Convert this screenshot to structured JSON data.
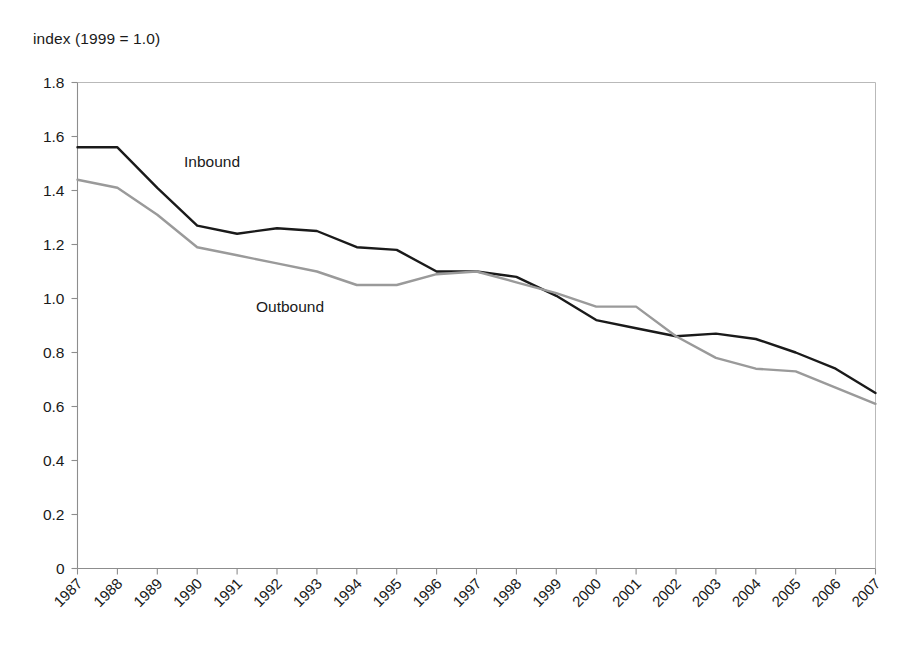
{
  "chart_data": {
    "type": "line",
    "title": "",
    "subtitle": "",
    "ylabel": "index (1999 = 1.0)",
    "xlabel": "",
    "ylim": [
      0,
      1.8
    ],
    "yticks": [
      "0",
      "0.2",
      "0.4",
      "0.6",
      "0.8",
      "1.0",
      "1.2",
      "1.4",
      "1.6",
      "1.8"
    ],
    "ytick_values": [
      0,
      0.2,
      0.4,
      0.6,
      0.8,
      1.0,
      1.2,
      1.4,
      1.6,
      1.8
    ],
    "grid": false,
    "legend_position": "inline-annotations",
    "categories": [
      "1987",
      "1988",
      "1989",
      "1990",
      "1991",
      "1992",
      "1993",
      "1994",
      "1995",
      "1996",
      "1997",
      "1998",
      "1999",
      "2000",
      "2001",
      "2002",
      "2003",
      "2004",
      "2005",
      "2006",
      "2007"
    ],
    "x": [
      1987,
      1988,
      1989,
      1990,
      1991,
      1992,
      1993,
      1994,
      1995,
      1996,
      1997,
      1998,
      1999,
      2000,
      2001,
      2002,
      2003,
      2004,
      2005,
      2006,
      2007
    ],
    "series": [
      {
        "name": "Inbound",
        "color": "#1a1a1a",
        "values": [
          1.56,
          1.56,
          1.41,
          1.27,
          1.24,
          1.26,
          1.25,
          1.19,
          1.18,
          1.1,
          1.1,
          1.08,
          1.01,
          0.92,
          0.89,
          0.86,
          0.87,
          0.85,
          0.8,
          0.74,
          0.65
        ]
      },
      {
        "name": "Outbound",
        "color": "#9a9a9a",
        "values": [
          1.44,
          1.41,
          1.31,
          1.19,
          1.16,
          1.13,
          1.1,
          1.05,
          1.05,
          1.09,
          1.1,
          1.06,
          1.02,
          0.97,
          0.97,
          0.86,
          0.78,
          0.74,
          0.73,
          0.67,
          0.61
        ]
      }
    ],
    "annotations": [
      {
        "text": "Inbound",
        "x_px": 184,
        "y_px": 167
      },
      {
        "text": "Outbound",
        "x_px": 256,
        "y_px": 312
      }
    ]
  },
  "figure": {
    "caption": "index (1999 = 1.0)"
  }
}
